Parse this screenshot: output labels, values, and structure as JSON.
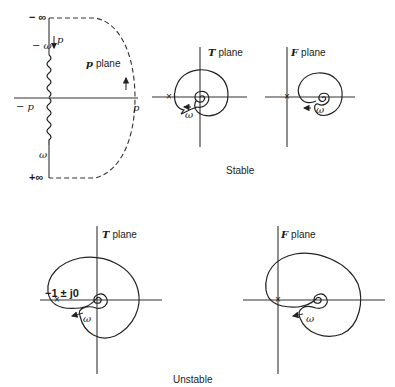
{
  "p_plane": {
    "title_var": "p",
    "title_word": "plane",
    "label_neg_inf": "− ∞",
    "label_pos_inf": "+∞",
    "label_neg_omega": "− ω",
    "label_omega": "ω",
    "label_p_arrow": "p",
    "label_neg_p": "− p",
    "label_p": "p"
  },
  "stable": {
    "caption": "Stable",
    "t_plane": {
      "title_var": "T",
      "title_word": "plane",
      "omega": "ω",
      "marker": "×"
    },
    "f_plane": {
      "title_var": "F",
      "title_word": "plane",
      "omega": "ω",
      "marker": "×"
    }
  },
  "unstable": {
    "caption": "Unstable",
    "t_plane": {
      "title_var": "T",
      "title_word": "plane",
      "omega": "ω",
      "marker": "×",
      "point_label": "−1 ± j0"
    },
    "f_plane": {
      "title_var": "F",
      "title_word": "plane",
      "omega": "ω",
      "marker": "×"
    }
  }
}
